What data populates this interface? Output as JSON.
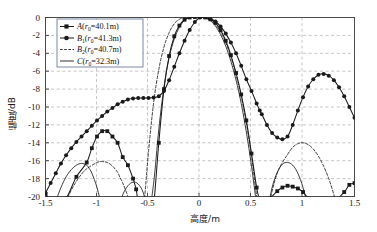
{
  "chart_data": {
    "type": "line",
    "title": "",
    "xlabel": "高度/m",
    "ylabel": "幅度/dB",
    "xlim": [
      -1.5,
      1.5
    ],
    "ylim": [
      -20,
      0
    ],
    "xticks": [
      "-1.5",
      "-1",
      "-0.5",
      "0",
      "0.5",
      "1",
      "1.5"
    ],
    "xtick_values": [
      -1.5,
      -1,
      -0.5,
      0,
      0.5,
      1,
      1.5
    ],
    "yticks": [
      "0",
      "-2",
      "-4",
      "-6",
      "-8",
      "-10",
      "-12",
      "-14",
      "-16",
      "-18",
      "-20"
    ],
    "ytick_values": [
      0,
      -2,
      -4,
      -6,
      -8,
      -10,
      -12,
      -14,
      -16,
      -18,
      -20
    ],
    "grid": true,
    "grid_style": "dashed",
    "legend_position": "top-left-inside",
    "series": [
      {
        "name": "A",
        "label": "A(r₀=40.1m)",
        "label_main": "A(r",
        "label_sub": "0",
        "label_tail": "=40.1m)",
        "marker": "square",
        "linestyle": "solid",
        "color": "#1a1a1a",
        "x": [
          -1.5,
          -1.45,
          -1.4,
          -1.3,
          -1.2,
          -1.1,
          -1.05,
          -1.0,
          -0.95,
          -0.9,
          -0.85,
          -0.8,
          -0.75,
          -0.7,
          -0.65,
          -0.62,
          -0.6,
          -0.55,
          -0.5,
          -0.45,
          -0.4,
          -0.35,
          -0.3,
          -0.25,
          -0.2,
          -0.15,
          -0.1,
          -0.05,
          0.0,
          0.05,
          0.1,
          0.15,
          0.2,
          0.25,
          0.3,
          0.35,
          0.4,
          0.45,
          0.5,
          0.55,
          0.58,
          0.62,
          0.68,
          0.75,
          0.8,
          0.85,
          0.9,
          0.95,
          1.0,
          1.05,
          1.1,
          1.2,
          1.3,
          1.4,
          1.45,
          1.5
        ],
        "y": [
          -19.7,
          -20.4,
          -20.8,
          -20.2,
          -17.8,
          -16.2,
          -14.6,
          -13.3,
          -12.7,
          -12.7,
          -13.3,
          -14.0,
          -15.6,
          -16.5,
          -18.0,
          -19.2,
          -20.6,
          -23.0,
          -24.5,
          -21.0,
          -14.0,
          -8.0,
          -4.3,
          -2.1,
          -0.9,
          -0.25,
          0.0,
          0.05,
          0.05,
          0.0,
          -0.2,
          -0.6,
          -1.4,
          -2.6,
          -4.2,
          -6.2,
          -8.6,
          -11.5,
          -15.2,
          -19.0,
          -20.4,
          -20.8,
          -20.2,
          -19.4,
          -19.0,
          -18.8,
          -18.9,
          -19.1,
          -19.5,
          -20.2,
          -20.8,
          -21.2,
          -20.6,
          -19.5,
          -18.7,
          -18.5
        ],
        "clip_bottom": -20
      },
      {
        "name": "B1",
        "label": "B₁(r₀=41.3m)",
        "label_main": "B",
        "label_sub": "1",
        "label_mid": "(r",
        "label_sub2": "0",
        "label_tail": "=41.3m)",
        "marker": "circle",
        "linestyle": "solid",
        "color": "#1a1a1a",
        "x": [
          -1.5,
          -1.45,
          -1.4,
          -1.35,
          -1.3,
          -1.25,
          -1.2,
          -1.15,
          -1.1,
          -1.05,
          -1.0,
          -0.95,
          -0.9,
          -0.85,
          -0.8,
          -0.75,
          -0.7,
          -0.65,
          -0.6,
          -0.55,
          -0.5,
          -0.45,
          -0.4,
          -0.35,
          -0.3,
          -0.25,
          -0.2,
          -0.15,
          -0.1,
          -0.05,
          0.0,
          0.05,
          0.1,
          0.15,
          0.2,
          0.25,
          0.3,
          0.35,
          0.4,
          0.45,
          0.5,
          0.55,
          0.58,
          0.6,
          0.65,
          0.7,
          0.75,
          0.8,
          0.85,
          0.9,
          0.95,
          1.0,
          1.05,
          1.1,
          1.15,
          1.2,
          1.25,
          1.3,
          1.35,
          1.4,
          1.45,
          1.5
        ],
        "y": [
          -19.6,
          -18.5,
          -17.4,
          -16.3,
          -15.4,
          -14.6,
          -13.9,
          -13.3,
          -12.7,
          -12.1,
          -11.5,
          -11.0,
          -10.5,
          -10.1,
          -9.7,
          -9.4,
          -9.15,
          -9.05,
          -9.0,
          -9.0,
          -9.0,
          -8.95,
          -8.8,
          -8.2,
          -7.0,
          -5.5,
          -4.0,
          -2.6,
          -1.4,
          -0.5,
          0.0,
          0.05,
          -0.1,
          -0.45,
          -1.0,
          -1.8,
          -2.8,
          -4.0,
          -5.4,
          -6.9,
          -8.2,
          -9.6,
          -10.4,
          -10.8,
          -12.0,
          -12.9,
          -13.4,
          -13.6,
          -13.3,
          -12.0,
          -10.4,
          -8.9,
          -7.7,
          -6.9,
          -6.4,
          -6.3,
          -6.5,
          -7.0,
          -7.8,
          -8.8,
          -10.0,
          -11.2
        ],
        "clip_bottom": -20
      },
      {
        "name": "B2",
        "label": "B₂(r₀=40.7m)",
        "label_main": "B",
        "label_sub": "2",
        "label_mid": "(r",
        "label_sub2": "0",
        "label_tail": "=40.7m)",
        "marker": "none",
        "linestyle": "dashed",
        "color": "#1a1a1a",
        "x": [
          -1.5,
          -1.4,
          -1.3,
          -1.25,
          -1.2,
          -1.15,
          -1.1,
          -1.0,
          -0.95,
          -0.9,
          -0.85,
          -0.8,
          -0.78,
          -0.75,
          -0.7,
          -0.65,
          -0.6,
          -0.55,
          -0.5,
          -0.45,
          -0.4,
          -0.35,
          -0.3,
          -0.25,
          -0.2,
          -0.15,
          -0.1,
          -0.05,
          0.0,
          0.05,
          0.1,
          0.15,
          0.2,
          0.25,
          0.3,
          0.35,
          0.4,
          0.45,
          0.5,
          0.55,
          0.6,
          0.62,
          0.65,
          0.7,
          0.75,
          0.8,
          0.85,
          0.9,
          0.95,
          1.0,
          1.05,
          1.1,
          1.15,
          1.2,
          1.25,
          1.3,
          1.35,
          1.4,
          1.45,
          1.5
        ],
        "y": [
          -24.0,
          -22.5,
          -20.5,
          -19.3,
          -18.3,
          -17.5,
          -16.9,
          -16.2,
          -16.1,
          -16.2,
          -16.6,
          -17.3,
          -17.8,
          -18.5,
          -20.0,
          -22.0,
          -24.5,
          -21.5,
          -15.0,
          -9.5,
          -5.8,
          -3.3,
          -1.7,
          -0.7,
          -0.2,
          0.0,
          0.0,
          0.0,
          0.0,
          -0.05,
          -0.3,
          -0.8,
          -1.6,
          -2.8,
          -4.4,
          -6.4,
          -8.8,
          -11.8,
          -15.5,
          -20.0,
          -24.5,
          -24.0,
          -22.2,
          -19.4,
          -17.4,
          -16.2,
          -15.3,
          -14.5,
          -14.1,
          -14.0,
          -14.2,
          -14.7,
          -15.5,
          -16.6,
          -18.0,
          -19.8,
          -21.8,
          -23.5,
          -23.0,
          -21.5
        ],
        "clip_bottom": -20
      },
      {
        "name": "C",
        "label": "C(r₀=32.3m)",
        "label_main": "C(r",
        "label_sub": "0",
        "label_tail": "=32.3m)",
        "marker": "none",
        "linestyle": "solid",
        "color": "#1a1a1a",
        "x": [
          -1.5,
          -1.45,
          -1.42,
          -1.4,
          -1.35,
          -1.3,
          -1.25,
          -1.2,
          -1.15,
          -1.1,
          -1.08,
          -1.05,
          -1.0,
          -0.95,
          -0.9,
          -0.85,
          -0.8,
          -0.75,
          -0.7,
          -0.65,
          -0.6,
          -0.55,
          -0.5,
          -0.45,
          -0.4,
          -0.35,
          -0.3,
          -0.25,
          -0.2,
          -0.15,
          -0.1,
          -0.05,
          0.0,
          0.05,
          0.1,
          0.15,
          0.2,
          0.25,
          0.3,
          0.35,
          0.4,
          0.45,
          0.5,
          0.55,
          0.6,
          0.62,
          0.65,
          0.7,
          0.75,
          0.8,
          0.85,
          0.9,
          0.95,
          1.0,
          1.05,
          1.1,
          1.15,
          1.2,
          1.25,
          1.3,
          1.35,
          1.4,
          1.45,
          1.5
        ],
        "y": [
          -26.0,
          -23.5,
          -22.0,
          -20.6,
          -19.0,
          -17.8,
          -17.0,
          -16.5,
          -16.3,
          -16.5,
          -16.8,
          -17.4,
          -19.0,
          -21.5,
          -25.0,
          -24.0,
          -21.5,
          -19.8,
          -18.8,
          -18.4,
          -18.6,
          -19.6,
          -21.8,
          -18.5,
          -12.5,
          -7.8,
          -4.5,
          -2.4,
          -1.1,
          -0.3,
          0.0,
          0.05,
          0.05,
          -0.05,
          -0.35,
          -0.95,
          -1.9,
          -3.2,
          -4.9,
          -7.0,
          -9.6,
          -12.8,
          -16.6,
          -21.0,
          -25.5,
          -24.5,
          -22.0,
          -19.0,
          -17.3,
          -16.4,
          -16.2,
          -16.5,
          -17.4,
          -19.0,
          -21.4,
          -25.0,
          -24.5,
          -22.8,
          -21.8,
          -21.5,
          -21.9,
          -22.9,
          -24.6,
          -26.5
        ],
        "clip_bottom": -20
      }
    ]
  },
  "axes": {
    "x_label": "高度/m",
    "y_label": "幅度/dB",
    "x_tick_labels": [
      "-1.5",
      "-1",
      "-0.5",
      "0",
      "0.5",
      "1",
      "1.5"
    ],
    "y_tick_labels": [
      "0",
      "-2",
      "-4",
      "-6",
      "-8",
      "-10",
      "-12",
      "-14",
      "-16",
      "-18",
      "-20"
    ]
  },
  "style": {
    "line_color": "#1a1a1a",
    "grid_color": "#9a9a9a",
    "axis_color": "#4a4a4a",
    "background": "#ffffff",
    "legend_border": "#5b6a8f"
  }
}
